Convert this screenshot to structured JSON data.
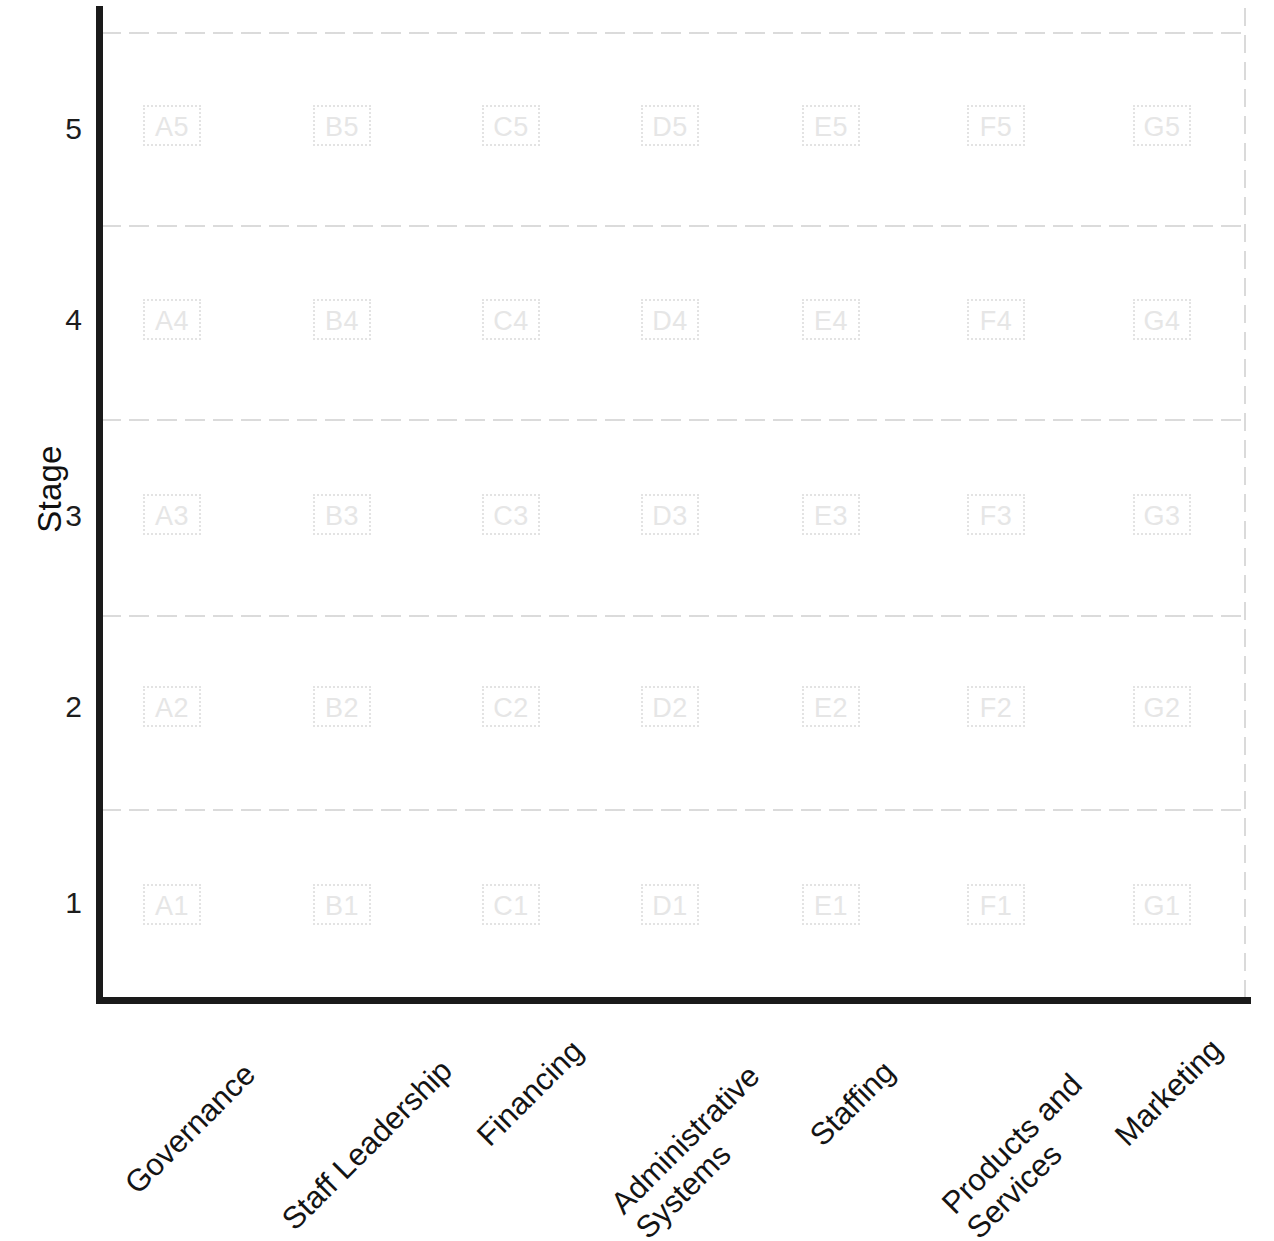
{
  "chart_data": {
    "type": "table",
    "title": "",
    "xlabel": "",
    "ylabel": "Stage",
    "grid": true,
    "legend": "none",
    "ylim": [
      1,
      5
    ],
    "categories": [
      "Governance",
      "Staff Leadership",
      "Financing",
      "Administrative Systems",
      "Staffing",
      "Products and Services",
      "Marketing"
    ],
    "category_letters": [
      "A",
      "B",
      "C",
      "D",
      "E",
      "F",
      "G"
    ],
    "stages": [
      "5",
      "4",
      "3",
      "2",
      "1"
    ],
    "cells": [
      [
        "A5",
        "B5",
        "C5",
        "D5",
        "E5",
        "F5",
        "G5"
      ],
      [
        "A4",
        "B4",
        "C4",
        "D4",
        "E4",
        "F4",
        "G4"
      ],
      [
        "A3",
        "B3",
        "C3",
        "D3",
        "E3",
        "F3",
        "G3"
      ],
      [
        "A2",
        "B2",
        "C2",
        "D2",
        "E2",
        "F2",
        "G2"
      ],
      [
        "A1",
        "B1",
        "C1",
        "D1",
        "E1",
        "F1",
        "G1"
      ]
    ],
    "colors": {
      "axis": "#1a1a1a",
      "gridline": "#d9d9d9",
      "cell_border": "#e3e3e3",
      "cell_text": "#e6e6e6",
      "label_text": "#141414",
      "background": "#ffffff"
    }
  },
  "axes": {
    "y_title": "Stage",
    "y_ticks": [
      "5",
      "4",
      "3",
      "2",
      "1"
    ],
    "x_categories": [
      {
        "label": "Governance",
        "line1": "Governance",
        "line2": ""
      },
      {
        "label": "Staff Leadership",
        "line1": "Staff Leadership",
        "line2": ""
      },
      {
        "label": "Financing",
        "line1": "Financing",
        "line2": ""
      },
      {
        "label": "Administrative Systems",
        "line1": "Administrative",
        "line2": "Systems"
      },
      {
        "label": "Staffing",
        "line1": "Staffing",
        "line2": ""
      },
      {
        "label": "Products and Services",
        "line1": "Products and",
        "line2": "Services"
      },
      {
        "label": "Marketing",
        "line1": "Marketing",
        "line2": ""
      }
    ]
  },
  "cells_flat": {
    "A5": "A5",
    "B5": "B5",
    "C5": "C5",
    "D5": "D5",
    "E5": "E5",
    "F5": "F5",
    "G5": "G5",
    "A4": "A4",
    "B4": "B4",
    "C4": "C4",
    "D4": "D4",
    "E4": "E4",
    "F4": "F4",
    "G4": "G4",
    "A3": "A3",
    "B3": "B3",
    "C3": "C3",
    "D3": "D3",
    "E3": "E3",
    "F3": "F3",
    "G3": "G3",
    "A2": "A2",
    "B2": "B2",
    "C2": "C2",
    "D2": "D2",
    "E2": "E2",
    "F2": "F2",
    "G2": "G2",
    "A1": "A1",
    "B1": "B1",
    "C1": "C1",
    "D1": "D1",
    "E1": "E1",
    "F1": "F1",
    "G1": "G1"
  }
}
